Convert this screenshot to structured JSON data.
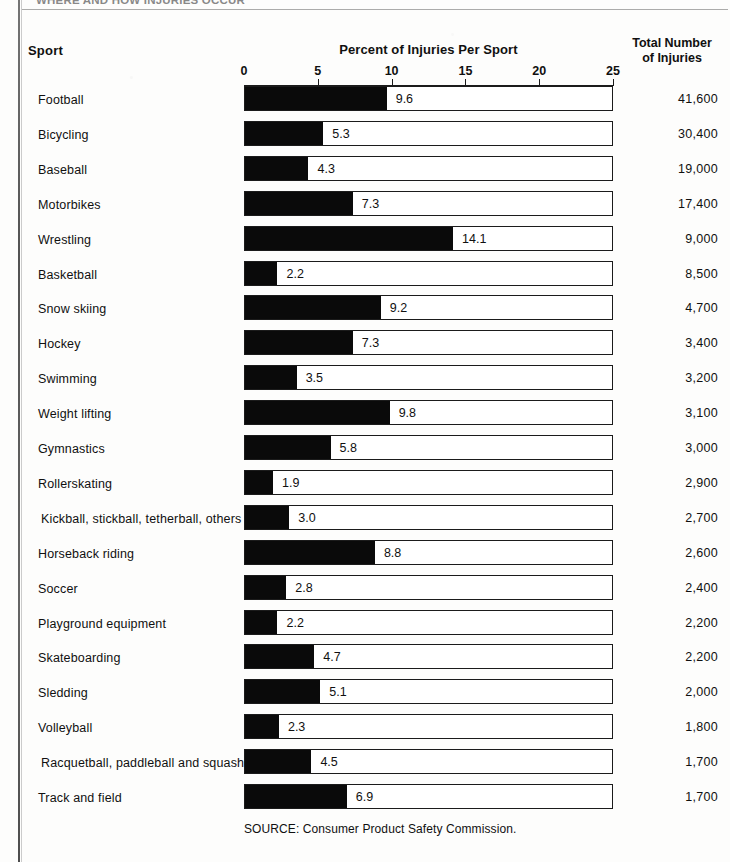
{
  "page": {
    "running_head": "WHERE AND HOW INJURIES OCCUR",
    "background_color": "#fdfdfc",
    "ink_color": "#0a0a0a"
  },
  "headers": {
    "sport": "Sport",
    "percent": "Percent of Injuries Per Sport",
    "total_line1": "Total Number",
    "total_line2": "of Injuries"
  },
  "source": "SOURCE: Consumer Product Safety Commission.",
  "chart_data": {
    "type": "bar",
    "orientation": "horizontal",
    "title": "Percent of Injuries Per Sport",
    "xlabel": "Percent of Injuries Per Sport",
    "ylabel": "Sport",
    "xlim": [
      0,
      25
    ],
    "xticks": [
      0,
      5,
      10,
      15,
      20,
      25
    ],
    "xtick_labels": [
      "0",
      "5",
      "10",
      "15",
      "20",
      "25"
    ],
    "grid": false,
    "legend": null,
    "bar_color": "#0a0a0a",
    "categories": [
      "Football",
      "Bicycling",
      "Baseball",
      "Motorbikes",
      "Wrestling",
      "Basketball",
      "Snow skiing",
      "Hockey",
      "Swimming",
      "Weight lifting",
      "Gymnastics",
      "Rollerskating",
      "Kickball, stickball, tetherball, others",
      "Horseback riding",
      "Soccer",
      "Playground equipment",
      "Skateboarding",
      "Sledding",
      "Volleyball",
      "Racquetball, paddleball and squash",
      "Track and field"
    ],
    "values": [
      9.6,
      5.3,
      4.3,
      7.3,
      14.1,
      2.2,
      9.2,
      7.3,
      3.5,
      9.8,
      5.8,
      1.9,
      3.0,
      8.8,
      2.8,
      2.2,
      4.7,
      5.1,
      2.3,
      4.5,
      6.9
    ],
    "value_labels": [
      "9.6",
      "5.3",
      "4.3",
      "7.3",
      "14.1",
      "2.2",
      "9.2",
      "7.3",
      "3.5",
      "9.8",
      "5.8",
      "1.9",
      "3.0",
      "8.8",
      "2.8",
      "2.2",
      "4.7",
      "5.1",
      "2.3",
      "4.5",
      "6.9"
    ],
    "secondary_column": {
      "label": "Total Number of Injuries",
      "values": [
        "41,600",
        "30,400",
        "19,000",
        "17,400",
        "9,000",
        "8,500",
        "4,700",
        "3,400",
        "3,200",
        "3,100",
        "3,000",
        "2,900",
        "2,700",
        "2,600",
        "2,400",
        "2,200",
        "2,200",
        "2,000",
        "1,800",
        "1,700",
        "1,700"
      ]
    }
  }
}
